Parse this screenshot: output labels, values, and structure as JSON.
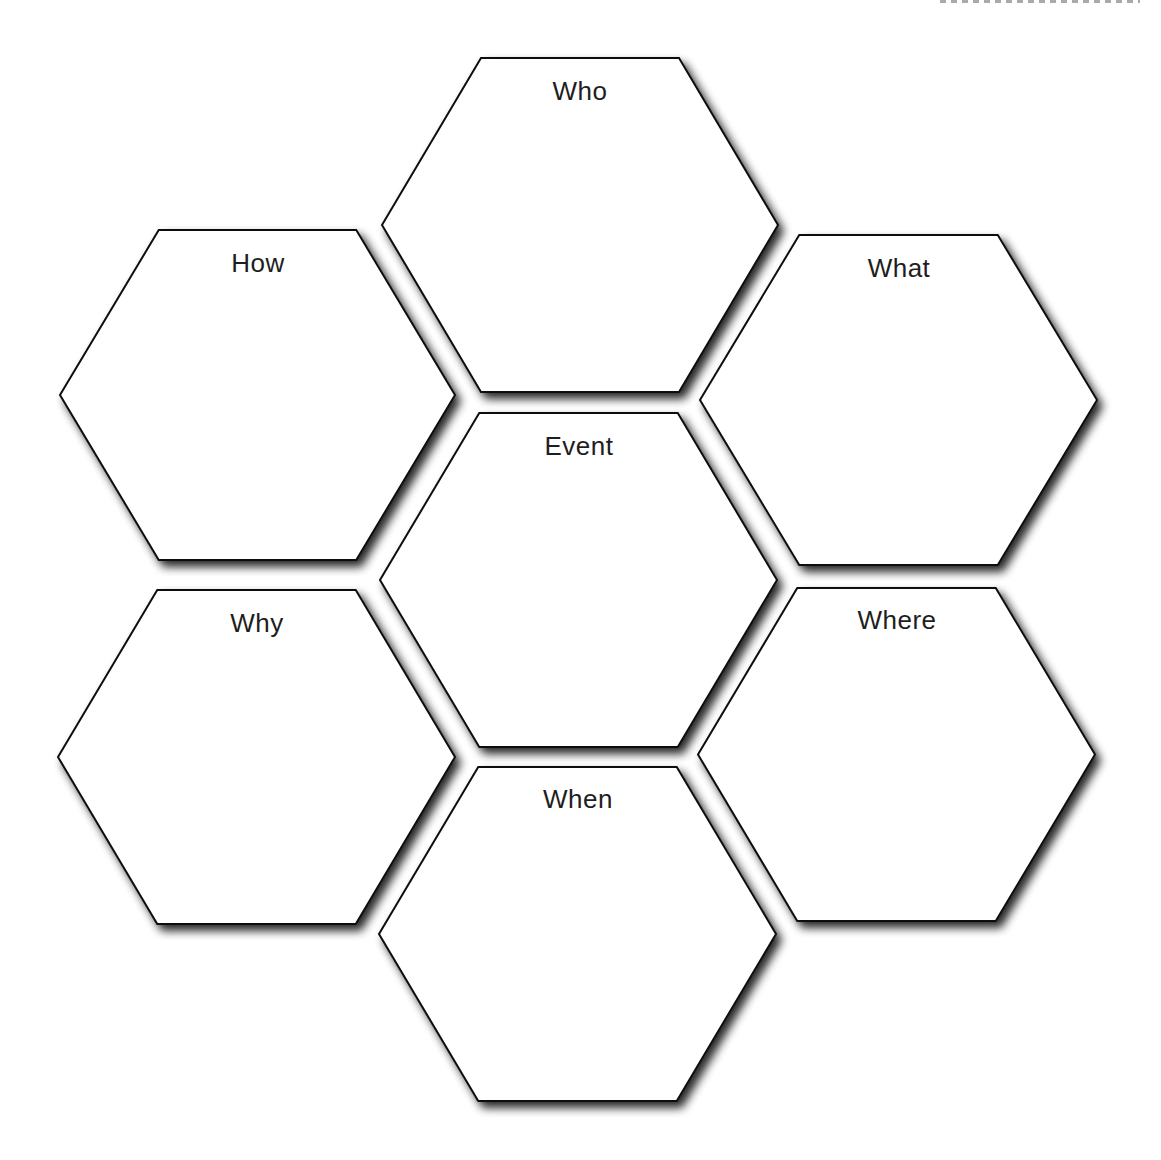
{
  "diagram": {
    "type": "hexagon-organizer",
    "center": "Event",
    "colors": {
      "background": "#ffffff",
      "stroke": "#111111",
      "fill": "#ffffff",
      "shadow": "#555555",
      "text": "#1e1e1e"
    },
    "hexagons": [
      {
        "id": "who",
        "label": "Who",
        "cx": 580,
        "top": 58,
        "bottom": 392,
        "left": 382,
        "right": 778
      },
      {
        "id": "how",
        "label": "How",
        "cx": 258,
        "top": 230,
        "bottom": 560,
        "left": 60,
        "right": 455
      },
      {
        "id": "what",
        "label": "What",
        "cx": 899,
        "top": 235,
        "bottom": 565,
        "left": 700,
        "right": 1097
      },
      {
        "id": "event",
        "label": "Event",
        "cx": 579,
        "top": 413,
        "bottom": 747,
        "left": 380,
        "right": 777
      },
      {
        "id": "why",
        "label": "Why",
        "cx": 257,
        "top": 590,
        "bottom": 924,
        "left": 58,
        "right": 455
      },
      {
        "id": "where",
        "label": "Where",
        "cx": 897,
        "top": 588,
        "bottom": 921,
        "left": 698,
        "right": 1095
      },
      {
        "id": "when",
        "label": "When",
        "cx": 578,
        "top": 767,
        "bottom": 1101,
        "left": 379,
        "right": 776
      }
    ]
  }
}
